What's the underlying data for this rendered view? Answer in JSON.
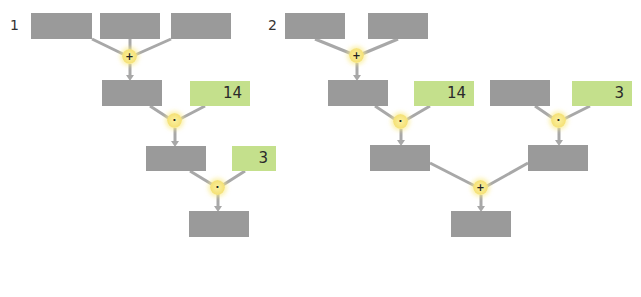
{
  "trees": [
    {
      "label": "1",
      "boxes": [
        {
          "id": "t1-in1",
          "value": "",
          "given": false
        },
        {
          "id": "t1-in2",
          "value": "",
          "given": false
        },
        {
          "id": "t1-in3",
          "value": "",
          "given": false
        },
        {
          "id": "t1-sum",
          "value": "",
          "given": false
        },
        {
          "id": "t1-c14",
          "value": "14",
          "given": true
        },
        {
          "id": "t1-prod1",
          "value": "",
          "given": false
        },
        {
          "id": "t1-c3",
          "value": "3",
          "given": true
        },
        {
          "id": "t1-result",
          "value": "",
          "given": false
        }
      ],
      "operators": [
        "+",
        "·",
        "·"
      ]
    },
    {
      "label": "2",
      "boxes": [
        {
          "id": "t2-in1",
          "value": "",
          "given": false
        },
        {
          "id": "t2-in2",
          "value": "",
          "given": false
        },
        {
          "id": "t2-sum",
          "value": "",
          "given": false
        },
        {
          "id": "t2-c14",
          "value": "14",
          "given": true
        },
        {
          "id": "t2-in3",
          "value": "",
          "given": false
        },
        {
          "id": "t2-c3",
          "value": "3",
          "given": true
        },
        {
          "id": "t2-prod1",
          "value": "",
          "given": false
        },
        {
          "id": "t2-prod2",
          "value": "",
          "given": false
        },
        {
          "id": "t2-result",
          "value": "",
          "given": false
        }
      ],
      "operators": [
        "+",
        "·",
        "·",
        "+"
      ]
    }
  ],
  "colors": {
    "empty_box": "#9a9a9a",
    "given_box": "#c4e08c",
    "operator": "#f5e27a",
    "connector": "#b0b0b0"
  }
}
